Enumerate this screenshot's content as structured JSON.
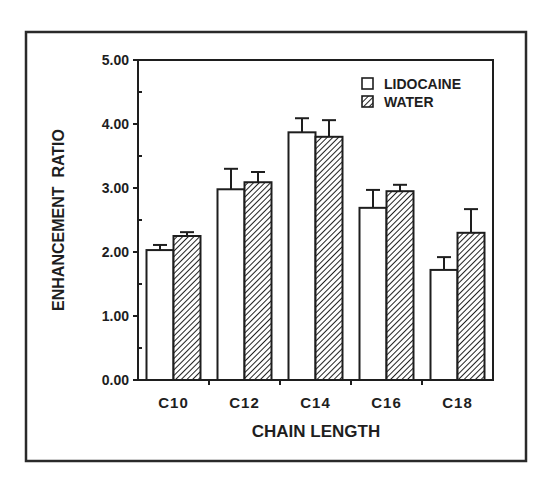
{
  "chart_data": {
    "type": "bar",
    "title": "",
    "xlabel": "CHAIN LENGTH",
    "ylabel": "ENHANCEMENT  RATIO",
    "ylim": [
      0,
      5
    ],
    "yticks": [
      "0.00",
      "1.00",
      "2.00",
      "3.00",
      "4.00",
      "5.00"
    ],
    "categories": [
      "C10",
      "C12",
      "C14",
      "C16",
      "C18"
    ],
    "series": [
      {
        "name": "LIDOCAINE",
        "pattern": "open",
        "values": [
          2.03,
          2.98,
          3.87,
          2.69,
          1.72
        ],
        "error_upper": [
          0.08,
          0.32,
          0.22,
          0.28,
          0.2
        ]
      },
      {
        "name": "WATER",
        "pattern": "hatched",
        "values": [
          2.25,
          3.09,
          3.8,
          2.95,
          2.3
        ],
        "error_upper": [
          0.06,
          0.16,
          0.26,
          0.1,
          0.37
        ]
      }
    ],
    "legend_position": "upper-right",
    "grid": false,
    "colors": {
      "line": "#1e1e1e",
      "background": "#ffffff"
    }
  }
}
